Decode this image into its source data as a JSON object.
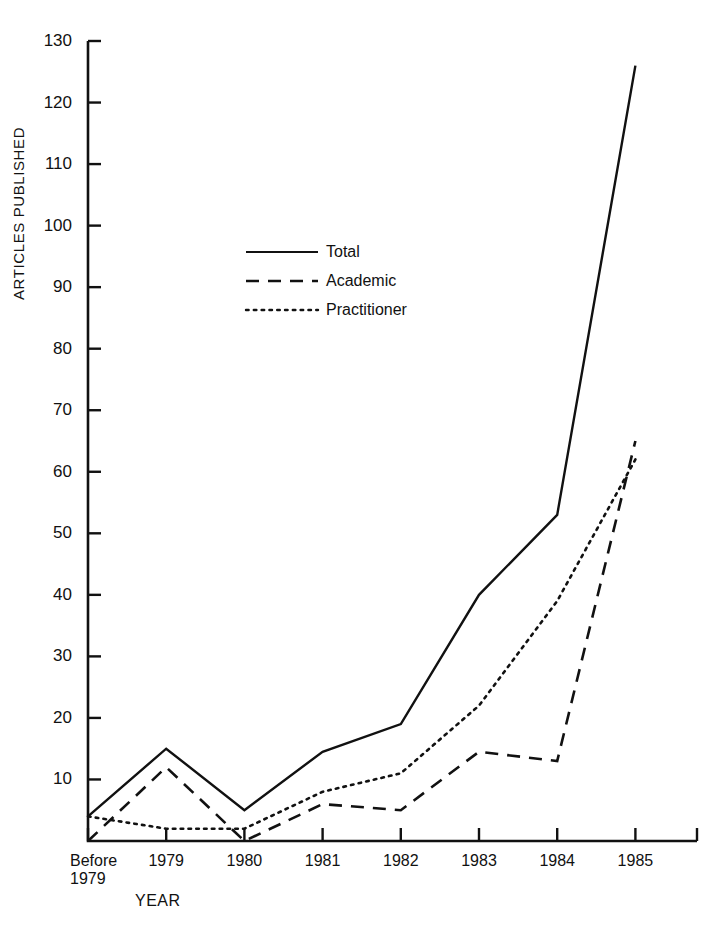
{
  "chart_data": {
    "type": "line",
    "title": "",
    "xlabel": "YEAR",
    "ylabel": "ARTICLES PUBLISHED",
    "categories": [
      "Before\n1979",
      "1979",
      "1980",
      "1981",
      "1982",
      "1983",
      "1984",
      "1985"
    ],
    "ylim": [
      0,
      130
    ],
    "ytick_labels": [
      "130",
      "120",
      "110",
      "100",
      "90",
      "80",
      "70",
      "60",
      "50",
      "40",
      "30",
      "20",
      "10"
    ],
    "yticks": [
      130,
      120,
      110,
      100,
      90,
      80,
      70,
      60,
      50,
      40,
      30,
      20,
      10
    ],
    "grid": false,
    "legend_position": "upper-center-left",
    "series": [
      {
        "name": "Total",
        "style": "solid",
        "values": [
          4,
          15,
          5,
          14.5,
          19,
          40,
          53,
          126
        ]
      },
      {
        "name": "Academic",
        "style": "dashed",
        "values": [
          0,
          12,
          0,
          6,
          5,
          14.5,
          13,
          65
        ]
      },
      {
        "name": "Practitioner",
        "style": "dotted",
        "values": [
          4,
          2,
          2,
          8,
          11,
          22,
          39,
          62
        ]
      }
    ],
    "colors": {
      "line": "#111111",
      "axis": "#111111",
      "background": "#ffffff"
    }
  },
  "axis": {
    "y_title": "ARTICLES PUBLISHED",
    "x_title": "YEAR"
  },
  "legend": {
    "items": [
      {
        "label": "Total"
      },
      {
        "label": "Academic"
      },
      {
        "label": "Practitioner"
      }
    ]
  },
  "xticks": [
    {
      "line1": "Before",
      "line2": "1979"
    },
    {
      "line1": "1979",
      "line2": ""
    },
    {
      "line1": "1980",
      "line2": ""
    },
    {
      "line1": "1981",
      "line2": ""
    },
    {
      "line1": "1982",
      "line2": ""
    },
    {
      "line1": "1983",
      "line2": ""
    },
    {
      "line1": "1984",
      "line2": ""
    },
    {
      "line1": "1985",
      "line2": ""
    }
  ]
}
